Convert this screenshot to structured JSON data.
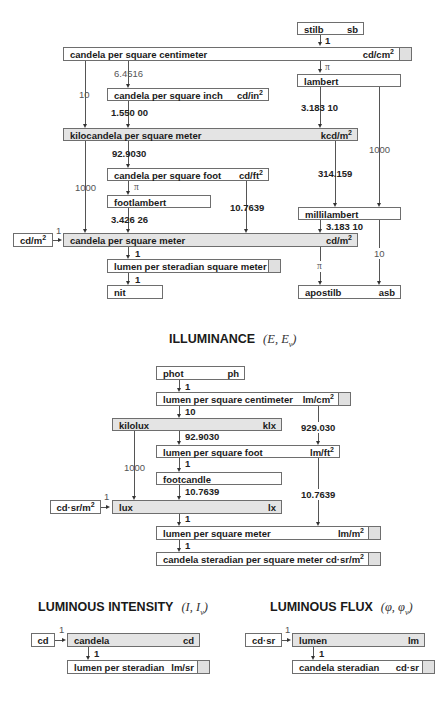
{
  "luminance": {
    "units": {
      "stilb": {
        "name": "stilb",
        "symbol": "sb"
      },
      "cd_cm2": {
        "name": "candela per square centimeter",
        "symbol": "cd/cm",
        "exp": "2"
      },
      "lambert": {
        "name": "lambert"
      },
      "cd_in2": {
        "name": "candela per square inch",
        "symbol": "cd/in",
        "exp": "2"
      },
      "kcd_m2": {
        "name": "kilocandela per square meter",
        "symbol": "kcd/m",
        "exp": "2"
      },
      "cd_ft2": {
        "name": "candela per square foot",
        "symbol": "cd/ft",
        "exp": "2"
      },
      "footlambert": {
        "name": "footlambert"
      },
      "millilambert": {
        "name": "millilambert"
      },
      "cd_m2": {
        "name": "candela per square meter",
        "symbol": "cd/m",
        "exp": "2"
      },
      "lm_sr_m2": {
        "name": "lumen per steradian square meter"
      },
      "nit": {
        "name": "nit"
      },
      "apostilb": {
        "name": "apostilb",
        "symbol": "asb"
      }
    },
    "input_bracket": {
      "symbol": "cd/m",
      "exp": "2",
      "factor": "1"
    },
    "factors": {
      "stilb_to_cdcm2": "1",
      "cdcm2_to_lambert": "π",
      "cdcm2_to_cdin2": "6.4516",
      "cdcm2_to_kcdm2": "10",
      "cdin2_to_kcdm2": "1.550 00",
      "lambert_to_kcdm2": "3.183 10",
      "lambert_to_millilambert": "1000",
      "kcdm2_to_cdft2": "92.9030",
      "kcdm2_to_cdm2": "1000",
      "kcdm2_to_millilambert": "314.159",
      "cdft2_to_footlambert": "π",
      "cdft2_to_cdm2": "10.7639",
      "footlambert_to_cdm2": "3.426 26",
      "millilambert_to_cdm2": "3.183 10",
      "millilambert_to_apostilb": "10",
      "cdm2_to_lmsrm2": "1",
      "cdm2_to_apostilb": "π",
      "lmsrm2_to_nit": "1"
    }
  },
  "illuminance": {
    "title": "ILLUMINANCE",
    "symbol": "(E, E",
    "symbol_sub": "v",
    "symbol_end": ")",
    "units": {
      "phot": {
        "name": "phot",
        "symbol": "ph"
      },
      "lm_cm2": {
        "name": "lumen per square centimeter",
        "symbol": "lm/cm",
        "exp": "2"
      },
      "kilolux": {
        "name": "kilolux",
        "symbol": "klx"
      },
      "lm_ft2": {
        "name": "lumen per square foot",
        "symbol": "lm/ft",
        "exp": "2"
      },
      "footcandle": {
        "name": "footcandle"
      },
      "lux": {
        "name": "lux",
        "symbol": "lx"
      },
      "lm_m2": {
        "name": "lumen per square meter",
        "symbol": "lm/m",
        "exp": "2"
      },
      "cd_sr_m2": {
        "name": "candela steradian per square meter",
        "symbol": "cd·sr/m",
        "exp": "2"
      }
    },
    "input_bracket": {
      "symbol": "cd·sr/m",
      "exp": "2",
      "factor": "1"
    },
    "factors": {
      "phot_to_lmcm2": "1",
      "lmcm2_to_kilolux": "10",
      "lmcm2_to_lmft2": "929.030",
      "kilolux_to_lmft2": "92.9030",
      "kilolux_to_lux": "1000",
      "lmft2_to_footcandle": "1",
      "footcandle_to_lux": "10.7639",
      "lmft2_to_lmm2": "10.7639",
      "lux_to_lmm2": "1",
      "lmm2_to_cdsrm2": "1"
    }
  },
  "intensity": {
    "title": "LUMINOUS INTENSITY",
    "symbol": "(I, I",
    "symbol_sub": "v",
    "symbol_end": ")",
    "input_bracket": {
      "symbol": "cd",
      "factor": "1"
    },
    "units": {
      "candela": {
        "name": "candela",
        "symbol": "cd"
      },
      "lm_sr": {
        "name": "lumen per steradian",
        "symbol": "lm/sr"
      }
    },
    "factors": {
      "candela_to_lmsr": "1"
    }
  },
  "flux": {
    "title": "LUMINOUS FLUX",
    "symbol": "(φ, φ",
    "symbol_sub": "v",
    "symbol_end": ")",
    "input_bracket": {
      "symbol": "cd·sr",
      "factor": "1"
    },
    "units": {
      "lumen": {
        "name": "lumen",
        "symbol": "lm"
      },
      "cd_sr": {
        "name": "candela steradian",
        "symbol": "cd·sr"
      }
    },
    "factors": {
      "lumen_to_cdsr": "1"
    }
  }
}
